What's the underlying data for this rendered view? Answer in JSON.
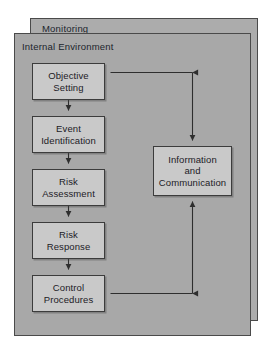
{
  "diagram": {
    "title_visible": false,
    "panels": [
      {
        "id": "monitoring",
        "label": "Monitoring"
      },
      {
        "id": "internal-environment",
        "label": "Internal Environment"
      }
    ],
    "nodes": [
      {
        "id": "objective-setting",
        "line1": "Objective",
        "line2": "Setting",
        "line3": ""
      },
      {
        "id": "event-identification",
        "line1": "Event",
        "line2": "Identification",
        "line3": ""
      },
      {
        "id": "risk-assessment",
        "line1": "Risk",
        "line2": "Assessment",
        "line3": ""
      },
      {
        "id": "risk-response",
        "line1": "Risk",
        "line2": "Response",
        "line3": ""
      },
      {
        "id": "control-procedures",
        "line1": "Control",
        "line2": "Procedures",
        "line3": ""
      },
      {
        "id": "information-communication",
        "line1": "Information",
        "line2": "and",
        "line3": "Communication"
      }
    ],
    "connectors": [
      {
        "from": "objective-setting",
        "to": "event-identification",
        "direction": "down"
      },
      {
        "from": "event-identification",
        "to": "risk-assessment",
        "direction": "down"
      },
      {
        "from": "risk-assessment",
        "to": "risk-response",
        "direction": "down"
      },
      {
        "from": "risk-response",
        "to": "control-procedures",
        "direction": "down"
      },
      {
        "from": "information-communication",
        "to": "objective-setting",
        "direction": "left"
      },
      {
        "from": "information-communication",
        "to": "control-procedures",
        "direction": "left"
      },
      {
        "from": "control-procedures",
        "to": "information-communication",
        "direction": "up"
      }
    ],
    "colors": {
      "page_background": "#ffffff",
      "panel_fill": "#a8a8a8",
      "panel_fill_outer": "#acacac",
      "node_fill": "#c9c9c9",
      "line": "#2e2e2e",
      "text": "#1c2026"
    }
  }
}
